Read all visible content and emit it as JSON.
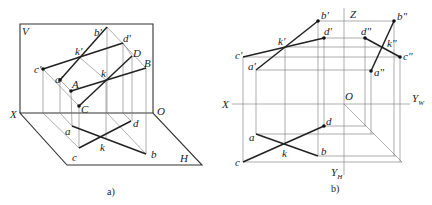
{
  "figures": {
    "a": {
      "caption": "a)",
      "plane_labels": {
        "V": "V",
        "H": "H",
        "X": "X",
        "O": "O"
      },
      "space_points": {
        "A": "A",
        "B": "B",
        "C": "C",
        "D": "D",
        "K": "k"
      },
      "v_projections": {
        "a": "a'",
        "b": "b'",
        "c": "c'",
        "d": "d'",
        "k": "k'"
      },
      "h_projections": {
        "a": "a",
        "b": "b",
        "c": "c",
        "d": "d",
        "k": "k"
      }
    },
    "b": {
      "caption": "b)",
      "axis_labels": {
        "X": "X",
        "Z": "Z",
        "O": "O",
        "YW": "Y",
        "YW_sub": "W",
        "YH": "Y",
        "YH_sub": "H"
      },
      "v_projections": {
        "a": "a'",
        "b": "b'",
        "c": "c'",
        "d": "d'",
        "k": "k'"
      },
      "w_projections": {
        "a": "a\"",
        "b": "b\"",
        "c": "c\"",
        "d": "d\"",
        "k": "k\""
      },
      "h_projections": {
        "a": "a",
        "b": "b",
        "c": "c",
        "d": "d",
        "k": "k"
      }
    }
  },
  "colors": {
    "line": "#222222",
    "projector": "#777777",
    "background": "#ffffff"
  }
}
